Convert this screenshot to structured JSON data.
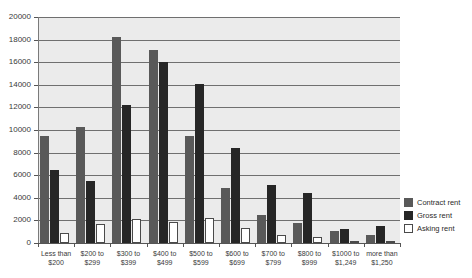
{
  "chart_data": {
    "type": "bar",
    "title": "",
    "xlabel": "",
    "ylabel": "",
    "ylim": [
      0,
      20000
    ],
    "ytick_step": 2000,
    "yticks": [
      "0",
      "2000",
      "4000",
      "6000",
      "8000",
      "10000",
      "12000",
      "14000",
      "16000",
      "18000",
      "20000"
    ],
    "grid": true,
    "legend_position": "right-bottom",
    "categories": [
      "Less than\n$200",
      "$200 to\n$299",
      "$300 to\n$399",
      "$400 to\n$499",
      "$500 to\n$599",
      "$600 to\n$699",
      "$700 to\n$799",
      "$800 to\n$999",
      "$1000 to\n$1,249",
      "more than\n$1,250"
    ],
    "series": [
      {
        "name": "Contract rent",
        "color": "#595959",
        "values": [
          9450,
          10250,
          18200,
          17100,
          9500,
          4900,
          2500,
          1800,
          1100,
          700
        ]
      },
      {
        "name": "Gross rent",
        "color": "#262626",
        "values": [
          6500,
          5500,
          12200,
          16000,
          14100,
          8400,
          5100,
          4400,
          1250,
          1550
        ]
      },
      {
        "name": "Asking rent",
        "color": "#ffffff",
        "values": [
          900,
          1700,
          2100,
          1850,
          2200,
          1300,
          700,
          500,
          200,
          150
        ]
      }
    ]
  }
}
